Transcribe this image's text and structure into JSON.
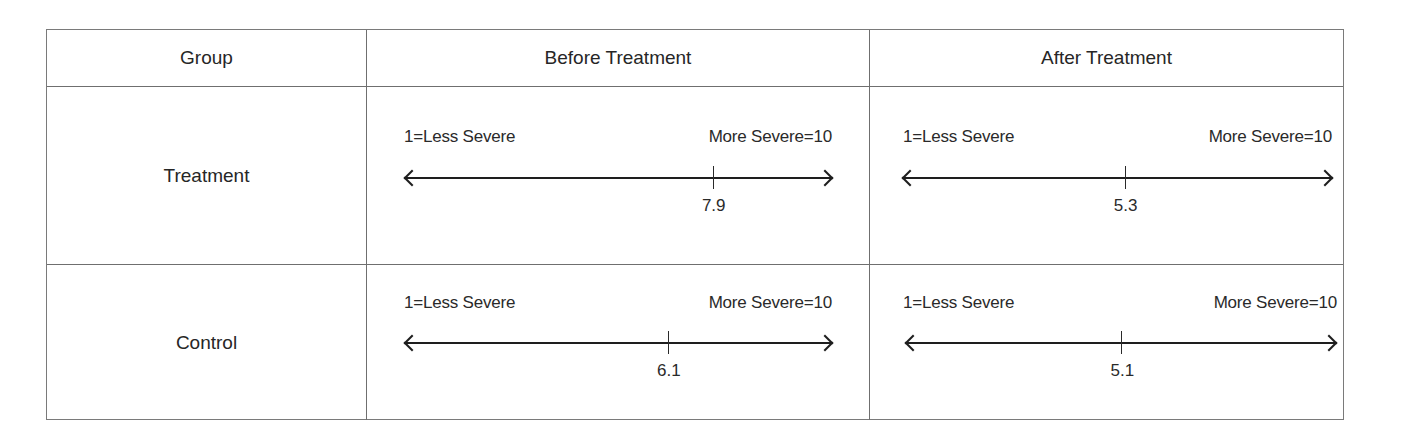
{
  "table": {
    "headers": [
      "Group",
      "Before Treatment",
      "After Treatment"
    ],
    "scale": {
      "left_label": "1=Less Severe",
      "right_label": "More Severe=10",
      "min": 1,
      "max": 10
    },
    "rows": [
      {
        "group": "Treatment",
        "before": {
          "value": "7.9",
          "tick_pct": 72.1
        },
        "after": {
          "value": "5.3",
          "tick_pct": 51.7
        }
      },
      {
        "group": "Control",
        "before": {
          "value": "6.1",
          "tick_pct": 61.6
        },
        "after": {
          "value": "5.1",
          "tick_pct": 50.1
        }
      }
    ]
  },
  "colors": {
    "border": "#6f6f6f",
    "text": "#262626",
    "axis": "#1e1e1e"
  }
}
